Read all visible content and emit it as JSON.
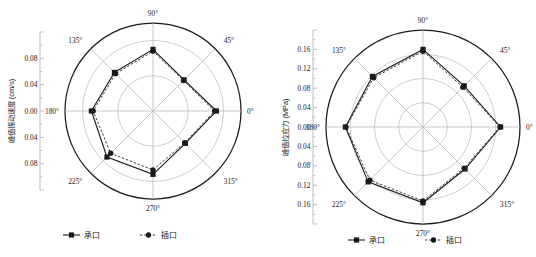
{
  "figure": {
    "panels": [
      {
        "name": "peak-vibration-velocity",
        "ylabel": "峰值振动速度 (cm/s)",
        "tick_labels": [
          "0.08",
          "0.04",
          "0.00",
          "0.04",
          "0.08"
        ],
        "angle_labels": [
          "0°",
          "45°",
          "90°",
          "135°",
          "180°",
          "225°",
          "270°",
          "315°"
        ],
        "legend": [
          {
            "label": "承口",
            "marker": "square",
            "line": "solid"
          },
          {
            "label": "插口",
            "marker": "circle",
            "line": "dashed"
          }
        ]
      },
      {
        "name": "peak-tensile-stress",
        "ylabel": "峰值拉应力 (MPa)",
        "tick_labels": [
          "0.16",
          "0.12",
          "0.08",
          "0.04",
          "0.00",
          "0.04",
          "0.08",
          "0.12",
          "0.16"
        ],
        "angle_labels": [
          "0°",
          "45°",
          "90°",
          "135°",
          "180°",
          "225°",
          "270°",
          "315°"
        ],
        "legend": [
          {
            "label": "承口",
            "marker": "square",
            "line": "solid"
          },
          {
            "label": "插口",
            "marker": "circle",
            "line": "dashed"
          }
        ]
      }
    ],
    "colors": {
      "axis": "#b0b0b0",
      "grid": "#b8b8b8",
      "outer": "#1a1a1a",
      "series_a": "#1a1a1a",
      "series_b": "#1a1a1a",
      "text": "#1a1a1a",
      "background": "#ffffff"
    }
  },
  "chart_data": [
    {
      "type": "line",
      "subtype": "polar",
      "title": "",
      "xlabel": "",
      "ylabel": "峰值振动速度 (cm/s)",
      "angles": [
        0,
        45,
        90,
        135,
        180,
        225,
        270,
        315
      ],
      "rlim": [
        0,
        0.1
      ],
      "rticks": [
        0.04,
        0.08,
        0.1
      ],
      "grid": true,
      "legend_position": "bottom",
      "series": [
        {
          "name": "承口",
          "marker": "square",
          "linestyle": "solid",
          "values": [
            0.072,
            0.05,
            0.07,
            0.062,
            0.07,
            0.074,
            0.072,
            0.052
          ]
        },
        {
          "name": "插口",
          "marker": "circle",
          "linestyle": "dashed",
          "values": [
            0.07,
            0.049,
            0.068,
            0.06,
            0.068,
            0.068,
            0.067,
            0.051
          ]
        }
      ]
    },
    {
      "type": "line",
      "subtype": "polar",
      "title": "",
      "xlabel": "",
      "ylabel": "峰值拉应力 (MPa)",
      "angles": [
        0,
        45,
        90,
        135,
        180,
        225,
        270,
        315
      ],
      "rlim": [
        0,
        0.16
      ],
      "rticks": [
        0.04,
        0.08,
        0.12,
        0.16
      ],
      "grid": true,
      "legend_position": "bottom",
      "series": [
        {
          "name": "承口",
          "marker": "square",
          "linestyle": "solid",
          "values": [
            0.128,
            0.096,
            0.128,
            0.118,
            0.128,
            0.128,
            0.125,
            0.098
          ]
        },
        {
          "name": "插口",
          "marker": "circle",
          "linestyle": "dashed",
          "values": [
            0.127,
            0.093,
            0.125,
            0.115,
            0.127,
            0.124,
            0.122,
            0.096
          ]
        }
      ]
    }
  ]
}
